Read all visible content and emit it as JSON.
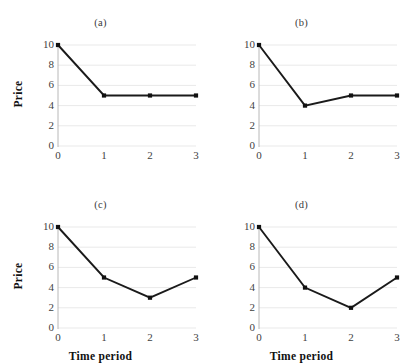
{
  "figure": {
    "rows": 2,
    "cols": 2,
    "background": "#ffffff",
    "line_color": "#1a1a1a",
    "marker_color": "#111111",
    "grid_color": "#e9e9e9",
    "axis_color": "#b8b8b8"
  },
  "chart_data": [
    {
      "type": "line",
      "title": "(a)",
      "xlabel": "",
      "ylabel": "Price",
      "x": [
        0,
        1,
        2,
        3
      ],
      "values": [
        10,
        5,
        5,
        5
      ],
      "xticklabels": [
        "0",
        "1",
        "2",
        "3"
      ],
      "yticklabels": [
        "0",
        "2",
        "4",
        "6",
        "8",
        "10"
      ],
      "yticks": [
        0,
        2,
        4,
        6,
        8,
        10
      ],
      "xlim": [
        0,
        3
      ],
      "ylim": [
        0,
        10
      ],
      "grid": "horizontal",
      "legend": "none",
      "marker": "square"
    },
    {
      "type": "line",
      "title": "(b)",
      "xlabel": "",
      "ylabel": "",
      "x": [
        0,
        1,
        2,
        3
      ],
      "values": [
        10,
        4,
        5,
        5
      ],
      "xticklabels": [
        "0",
        "1",
        "2",
        "3"
      ],
      "yticklabels": [
        "0",
        "2",
        "4",
        "6",
        "8",
        "10"
      ],
      "yticks": [
        0,
        2,
        4,
        6,
        8,
        10
      ],
      "xlim": [
        0,
        3
      ],
      "ylim": [
        0,
        10
      ],
      "grid": "horizontal",
      "legend": "none",
      "marker": "square"
    },
    {
      "type": "line",
      "title": "(c)",
      "xlabel": "Time period",
      "ylabel": "Price",
      "x": [
        0,
        1,
        2,
        3
      ],
      "values": [
        10,
        5,
        3,
        5
      ],
      "xticklabels": [
        "0",
        "1",
        "2",
        "3"
      ],
      "yticklabels": [
        "0",
        "2",
        "4",
        "6",
        "8",
        "10"
      ],
      "yticks": [
        0,
        2,
        4,
        6,
        8,
        10
      ],
      "xlim": [
        0,
        3
      ],
      "ylim": [
        0,
        10
      ],
      "grid": "horizontal",
      "legend": "none",
      "marker": "square"
    },
    {
      "type": "line",
      "title": "(d)",
      "xlabel": "Time period",
      "ylabel": "",
      "x": [
        0,
        1,
        2,
        3
      ],
      "values": [
        10,
        4,
        2,
        5
      ],
      "xticklabels": [
        "0",
        "1",
        "2",
        "3"
      ],
      "yticklabels": [
        "0",
        "2",
        "4",
        "6",
        "8",
        "10"
      ],
      "yticks": [
        0,
        2,
        4,
        6,
        8,
        10
      ],
      "xlim": [
        0,
        3
      ],
      "ylim": [
        0,
        10
      ],
      "grid": "horizontal",
      "legend": "none",
      "marker": "square"
    }
  ]
}
